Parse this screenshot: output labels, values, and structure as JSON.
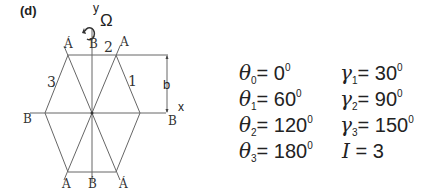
{
  "panel_label": "(d)",
  "axes": {
    "y": "y",
    "x": "x",
    "rotation": "Ω"
  },
  "dimension_label": "b",
  "side_labels": {
    "top": "2",
    "right": "1",
    "left": "3"
  },
  "vertex_labels": {
    "top_left": "Á",
    "top_center": "Ḃ",
    "top_right": "A",
    "left": "B",
    "right": "B",
    "bottom_left": "A",
    "bottom_center": "Ḃ",
    "bottom_right": "Á"
  },
  "theta": [
    {
      "sym": "θ",
      "sub": "0",
      "value": "0",
      "unit": "0"
    },
    {
      "sym": "θ",
      "sub": "1",
      "value": "60",
      "unit": "0"
    },
    {
      "sym": "θ",
      "sub": "2",
      "value": "120",
      "unit": "0"
    },
    {
      "sym": "θ",
      "sub": "3",
      "value": "180",
      "unit": "0"
    }
  ],
  "gamma": [
    {
      "sym": "γ",
      "sub": "1",
      "value": "30",
      "unit": "0"
    },
    {
      "sym": "γ",
      "sub": "2",
      "value": "90",
      "unit": "0"
    },
    {
      "sym": "γ",
      "sub": "3",
      "value": "150",
      "unit": "0"
    }
  ],
  "current": {
    "sym": "I",
    "value": "3"
  },
  "equals": "= "
}
